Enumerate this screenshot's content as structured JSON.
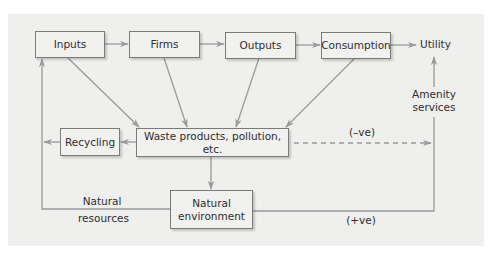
{
  "diagram": {
    "nodes": {
      "inputs": "Inputs",
      "firms": "Firms",
      "outputs": "Outputs",
      "consumption": "Consumption",
      "utility": "Utility",
      "recycling": "Recycling",
      "waste": "Waste products, pollution, etc.",
      "natural_environment_line1": "Natural",
      "natural_environment_line2": "environment"
    },
    "labels": {
      "amenity_line1": "Amenity",
      "amenity_line2": "services",
      "natural_resources_line1": "Natural",
      "natural_resources_line2": "resources",
      "negative_effect": "(–ve)",
      "positive_effect": "(+ve)"
    },
    "edges": [
      {
        "from": "Inputs",
        "to": "Firms"
      },
      {
        "from": "Firms",
        "to": "Outputs"
      },
      {
        "from": "Outputs",
        "to": "Consumption"
      },
      {
        "from": "Consumption",
        "to": "Utility"
      },
      {
        "from": "Inputs",
        "to": "Waste products, pollution, etc."
      },
      {
        "from": "Firms",
        "to": "Waste products, pollution, etc."
      },
      {
        "from": "Outputs",
        "to": "Waste products, pollution, etc."
      },
      {
        "from": "Consumption",
        "to": "Waste products, pollution, etc."
      },
      {
        "from": "Waste products, pollution, etc.",
        "to": "Recycling"
      },
      {
        "from": "Recycling",
        "to": "Inputs"
      },
      {
        "from": "Waste products, pollution, etc.",
        "to": "Natural environment"
      },
      {
        "from": "Natural environment",
        "to": "Inputs",
        "label": "Natural resources"
      },
      {
        "from": "Natural environment",
        "to": "Utility",
        "label": "Amenity services (+ve)"
      },
      {
        "from": "Waste products, pollution, etc.",
        "to": "Utility",
        "label": "(–ve)",
        "style": "dashed"
      }
    ],
    "colors": {
      "panel": "#efefee",
      "box_border": "#7a7a7a",
      "arrow": "#9a9a9a",
      "text": "#2e2e2e"
    }
  }
}
